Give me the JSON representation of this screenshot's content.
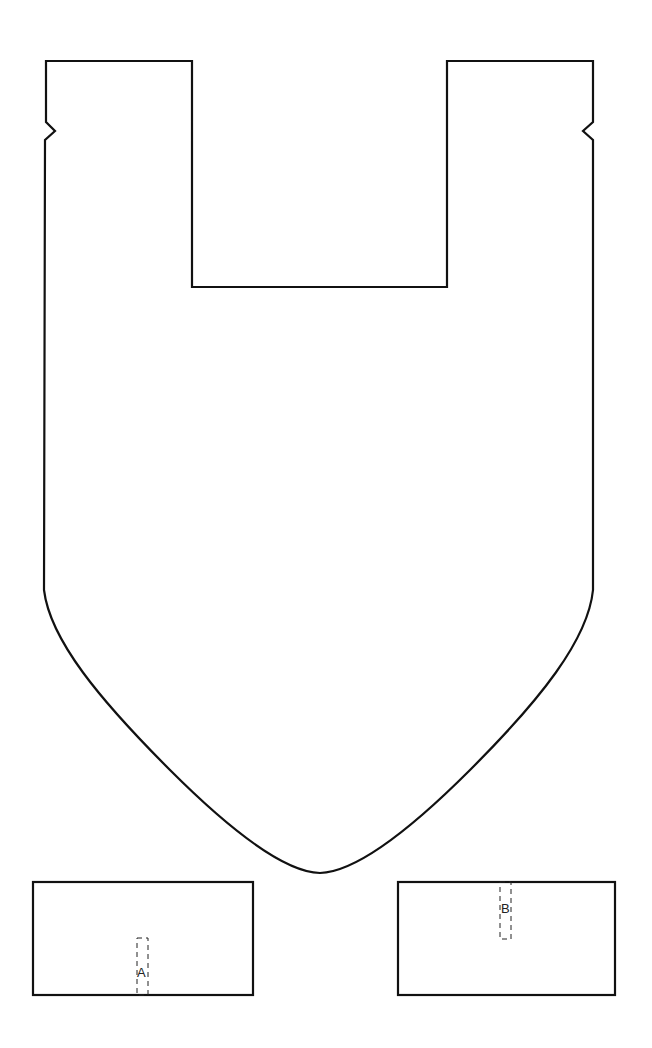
{
  "diagram": {
    "type": "cut-out pattern template",
    "stroke_color": "#111111",
    "background": "#ffffff",
    "main_piece": {
      "description": "U-shaped body with rounded V bottom and side notches",
      "notches": [
        "left",
        "right"
      ]
    },
    "strap_a": {
      "label": "A",
      "marker": "dashed placement rectangle at bottom edge"
    },
    "strap_b": {
      "label": "B",
      "marker": "dashed placement rectangle at top edge"
    }
  }
}
